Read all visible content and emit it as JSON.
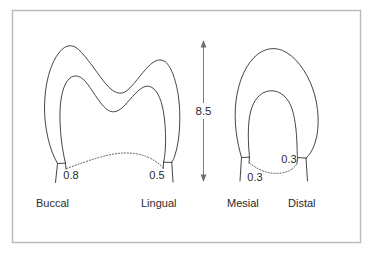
{
  "figure": {
    "background_color": "#ffffff",
    "frame_color": "#b9b9bb",
    "line_color": "#3b3b3d"
  },
  "crown_height": {
    "value": "8.5",
    "orientation": "vertical",
    "arrow_style": "double-headed"
  },
  "teeth": [
    {
      "id": "buccolingual-view",
      "description": "Buccolingual cross-section showing two cusps",
      "cusps": 2,
      "measurements": [
        {
          "label": "0.8",
          "side": "buccal"
        },
        {
          "label": "0.5",
          "side": "lingual"
        }
      ],
      "view_labels": [
        {
          "text": "Buccal",
          "position": "left"
        },
        {
          "text": "Lingual",
          "position": "right"
        }
      ]
    },
    {
      "id": "mesiodistal-view",
      "description": "Mesiodistal cross-section showing single rounded crown",
      "cusps": 1,
      "measurements": [
        {
          "label": "0.3",
          "side": "mesial"
        },
        {
          "label": "0.3",
          "side": "distal"
        }
      ],
      "view_labels": [
        {
          "text": "Mesial",
          "position": "left"
        },
        {
          "text": "Distal",
          "position": "right"
        }
      ]
    }
  ],
  "annotations": {
    "measure_buccal": "0.8",
    "measure_lingual": "0.5",
    "measure_mesial": "0.3",
    "measure_distal": "0.3",
    "dimension_height": "8.5",
    "label_buccal": "Buccal",
    "label_lingual": "Lingual",
    "label_mesial": "Mesial",
    "label_distal": "Distal"
  }
}
